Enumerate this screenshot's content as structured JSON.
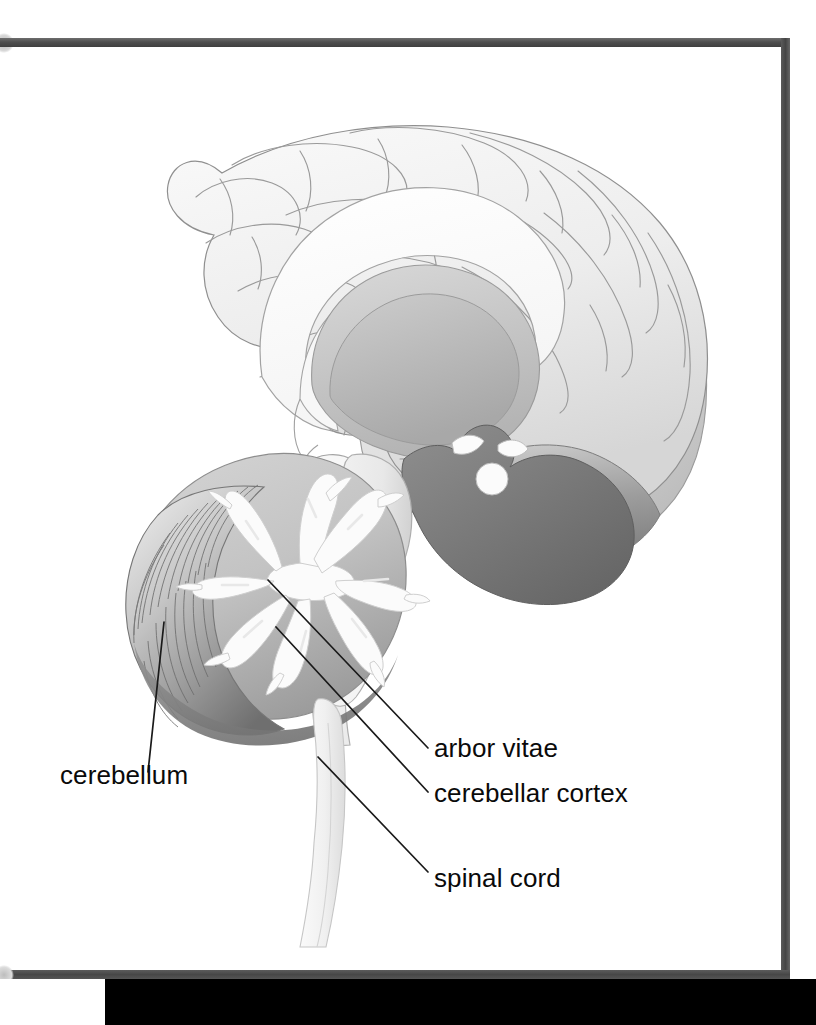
{
  "figure": {
    "style": "grayscale line-and-tone anatomical illustration"
  },
  "page_frame": {
    "border_color": "#4a4a4a",
    "bottom_band_color": "#000000",
    "background_color": "#ffffff"
  },
  "labels": [
    {
      "id": "cerebellum",
      "text": "cerebellum",
      "side": "left"
    },
    {
      "id": "arbor-vitae",
      "text": "arbor vitae",
      "side": "right"
    },
    {
      "id": "cerebellar-cortex",
      "text": "cerebellar cortex",
      "side": "right"
    },
    {
      "id": "spinal-cord",
      "text": "spinal cord",
      "side": "right"
    }
  ],
  "leader_lines": [
    {
      "id": "cerebellum-leader",
      "from": [
        164,
        622
      ],
      "to": [
        148,
        772
      ],
      "color": "#1a1a1a"
    },
    {
      "id": "arbor-vitae-leader",
      "from": [
        268,
        580
      ],
      "to": [
        428,
        748
      ],
      "color": "#1a1a1a"
    },
    {
      "id": "cerebellar-cortex-leader",
      "from": [
        276,
        627
      ],
      "to": [
        428,
        792
      ],
      "color": "#1a1a1a"
    },
    {
      "id": "spinal-cord-leader",
      "from": [
        318,
        757
      ],
      "to": [
        428,
        872
      ],
      "color": "#1a1a1a"
    }
  ],
  "anatomy": {
    "structures": [
      "cerebral cortex",
      "corpus callosum",
      "thalamus",
      "fornix",
      "midbrain",
      "pons",
      "medulla oblongata",
      "cerebellum",
      "arbor vitae",
      "cerebellar cortex",
      "spinal cord",
      "occipital lobe"
    ]
  },
  "palette": {
    "outline": "#8a8a8a",
    "cortex_light": "#f2f2f2",
    "cortex_mid": "#e2e2e2",
    "deep_gray": "#b8b8b8",
    "dark_gray": "#8e8e8e",
    "darkest": "#6a6a6a",
    "white_matter": "#fbfbfb",
    "text": "#0a0a0a"
  }
}
